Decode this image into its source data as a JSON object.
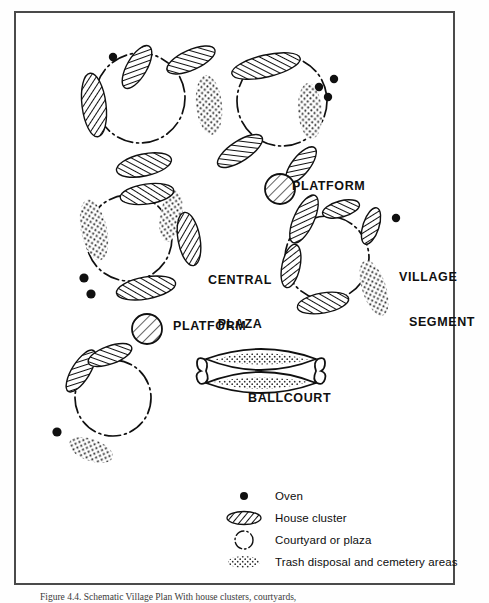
{
  "figure": {
    "kind": "archaeological-site-plan",
    "caption": "Figure 4.4.  Schematic Village Plan With house clusters, courtyards,",
    "background_color": "#ffffff",
    "frame_color": "#4a4a4a",
    "ink_color": "#101010"
  },
  "map": {
    "labels": {
      "platform_upper": "PLATFORM",
      "platform_lower": "PLATFORM",
      "central_plaza_line1": "CENTRAL",
      "central_plaza_line2": "PLAZA",
      "village_segment_line1": "VILLAGE",
      "village_segment_line2": "SEGMENT",
      "ballcourt": "BALLCOURT"
    },
    "courtyards": [
      {
        "name": "courtyard-upper-left",
        "cx": 124,
        "cy": 85,
        "r": 45
      },
      {
        "name": "courtyard-upper-right",
        "cx": 266,
        "cy": 88,
        "r": 45
      },
      {
        "name": "courtyard-middle-left",
        "cx": 113,
        "cy": 225,
        "r": 43
      },
      {
        "name": "courtyard-right",
        "cx": 311,
        "cy": 245,
        "r": 42
      },
      {
        "name": "courtyard-lower-left",
        "cx": 97,
        "cy": 385,
        "r": 38
      }
    ],
    "platforms": [
      {
        "name": "platform-upper",
        "cx": 264,
        "cy": 176,
        "r": 15
      },
      {
        "name": "platform-lower",
        "cx": 131,
        "cy": 316,
        "r": 15
      }
    ],
    "ballcourt": {
      "cx": 245,
      "cy": 357,
      "w": 110,
      "h": 34
    },
    "ovens": [
      {
        "name": "oven-upper-left",
        "cx": 97,
        "cy": 44,
        "r": 4.2
      },
      {
        "name": "oven-upper-right-1",
        "cx": 303,
        "cy": 74,
        "r": 4.2
      },
      {
        "name": "oven-upper-right-2",
        "cx": 318,
        "cy": 66,
        "r": 4.2
      },
      {
        "name": "oven-upper-right-3",
        "cx": 312,
        "cy": 84,
        "r": 4.2
      },
      {
        "name": "oven-mid-left-1",
        "cx": 68,
        "cy": 265,
        "r": 4.6
      },
      {
        "name": "oven-mid-left-2",
        "cx": 75,
        "cy": 281,
        "r": 4.6
      },
      {
        "name": "oven-right",
        "cx": 380,
        "cy": 205,
        "r": 4.2
      },
      {
        "name": "oven-lower-left",
        "cx": 41,
        "cy": 419,
        "r": 4.6
      }
    ],
    "house_clusters": [
      {
        "name": "house-cluster-ul-a",
        "cx": 78,
        "cy": 92,
        "rx": 12,
        "ry": 32,
        "rot": -7
      },
      {
        "name": "house-cluster-ul-b",
        "cx": 121,
        "cy": 54,
        "rx": 10,
        "ry": 24,
        "rot": 30
      },
      {
        "name": "house-cluster-ul-c",
        "cx": 175,
        "cy": 47,
        "rx": 10,
        "ry": 26,
        "rot": 66
      },
      {
        "name": "house-cluster-ul-d",
        "cx": 128,
        "cy": 152,
        "rx": 11,
        "ry": 28,
        "rot": 78
      },
      {
        "name": "house-cluster-ul-e",
        "cx": 131,
        "cy": 181,
        "rx": 10,
        "ry": 27,
        "rot": 82
      },
      {
        "name": "house-cluster-ur-a",
        "cx": 250,
        "cy": 53,
        "rx": 11,
        "ry": 35,
        "rot": 77
      },
      {
        "name": "house-cluster-ur-b",
        "cx": 224,
        "cy": 138,
        "rx": 10,
        "ry": 26,
        "rot": 57
      },
      {
        "name": "house-cluster-ur-c",
        "cx": 285,
        "cy": 152,
        "rx": 9,
        "ry": 22,
        "rot": 38
      },
      {
        "name": "house-cluster-ml-a",
        "cx": 173,
        "cy": 226,
        "rx": 11,
        "ry": 27,
        "rot": -10
      },
      {
        "name": "house-cluster-ml-b",
        "cx": 130,
        "cy": 275,
        "rx": 11,
        "ry": 30,
        "rot": 80
      },
      {
        "name": "house-cluster-r-a",
        "cx": 288,
        "cy": 206,
        "rx": 10,
        "ry": 26,
        "rot": 25
      },
      {
        "name": "house-cluster-r-b",
        "cx": 275,
        "cy": 253,
        "rx": 9,
        "ry": 22,
        "rot": 12
      },
      {
        "name": "house-cluster-r-c",
        "cx": 325,
        "cy": 196,
        "rx": 8,
        "ry": 19,
        "rot": 75
      },
      {
        "name": "house-cluster-r-d",
        "cx": 355,
        "cy": 213,
        "rx": 8,
        "ry": 19,
        "rot": 18
      },
      {
        "name": "house-cluster-r-e",
        "cx": 307,
        "cy": 290,
        "rx": 10,
        "ry": 26,
        "rot": 80
      },
      {
        "name": "house-cluster-ll-a",
        "cx": 65,
        "cy": 358,
        "rx": 9,
        "ry": 24,
        "rot": 32
      },
      {
        "name": "house-cluster-ll-b",
        "cx": 94,
        "cy": 342,
        "rx": 9,
        "ry": 23,
        "rot": 70
      }
    ],
    "trash_areas": [
      {
        "name": "trash-upper-center",
        "cx": 193,
        "cy": 92,
        "rx": 13,
        "ry": 30,
        "rot": -6
      },
      {
        "name": "trash-upper-right",
        "cx": 294,
        "cy": 98,
        "rx": 12,
        "ry": 28,
        "rot": -4
      },
      {
        "name": "trash-mid-left",
        "cx": 78,
        "cy": 217,
        "rx": 13,
        "ry": 31,
        "rot": -12
      },
      {
        "name": "trash-mid-right",
        "cx": 155,
        "cy": 203,
        "rx": 11,
        "ry": 26,
        "rot": 10
      },
      {
        "name": "trash-right",
        "cx": 358,
        "cy": 275,
        "rx": 12,
        "ry": 29,
        "rot": -18
      },
      {
        "name": "trash-lower-left",
        "cx": 75,
        "cy": 437,
        "rx": 23,
        "ry": 11,
        "rot": 20
      }
    ]
  },
  "legend": {
    "items": [
      {
        "glyph": "oven-dot-glyph",
        "label": "Oven"
      },
      {
        "glyph": "house-cluster-glyph",
        "label": "House cluster"
      },
      {
        "glyph": "courtyard-glyph",
        "label": "Courtyard or plaza"
      },
      {
        "glyph": "trash-area-glyph",
        "label": "Trash disposal and cemetery areas"
      }
    ]
  }
}
